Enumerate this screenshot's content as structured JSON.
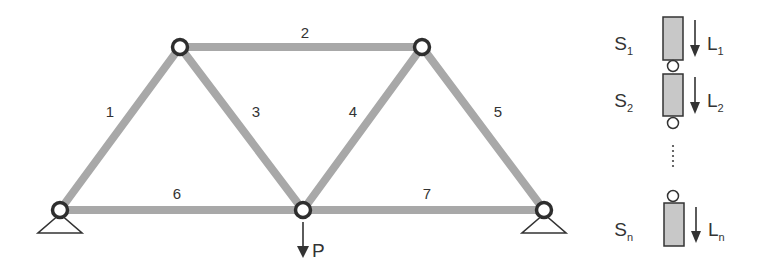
{
  "colors": {
    "background": "#ffffff",
    "member": "#a8a8a8",
    "node_stroke": "#2e2e2e",
    "node_fill": "#ffffff",
    "ink": "#333333",
    "element_fill": "#c8c8c8"
  },
  "truss": {
    "nodes": [
      {
        "id": "A",
        "x": 60,
        "y": 210,
        "support": "pin"
      },
      {
        "id": "B",
        "x": 180,
        "y": 47,
        "support": "none"
      },
      {
        "id": "C",
        "x": 303,
        "y": 210,
        "support": "none"
      },
      {
        "id": "D",
        "x": 422,
        "y": 47,
        "support": "none"
      },
      {
        "id": "E",
        "x": 544,
        "y": 210,
        "support": "pin"
      }
    ],
    "members": [
      {
        "label": "1",
        "from": "A",
        "to": "B",
        "label_x": 110,
        "label_y": 117
      },
      {
        "label": "2",
        "from": "B",
        "to": "D",
        "label_x": 305,
        "label_y": 38
      },
      {
        "label": "3",
        "from": "B",
        "to": "C",
        "label_x": 256,
        "label_y": 117
      },
      {
        "label": "4",
        "from": "C",
        "to": "D",
        "label_x": 353,
        "label_y": 117
      },
      {
        "label": "5",
        "from": "D",
        "to": "E",
        "label_x": 498,
        "label_y": 117
      },
      {
        "label": "6",
        "from": "A",
        "to": "C",
        "label_x": 177,
        "label_y": 199
      },
      {
        "label": "7",
        "from": "C",
        "to": "E",
        "label_x": 427,
        "label_y": 199
      }
    ],
    "load": {
      "label": "P",
      "node": "C",
      "direction": "down"
    }
  },
  "series_system": {
    "elements": [
      {
        "strength": "S",
        "strength_sub": "1",
        "load": "L",
        "load_sub": "1"
      },
      {
        "strength": "S",
        "strength_sub": "2",
        "load": "L",
        "load_sub": "2"
      },
      {
        "strength": "S",
        "strength_sub": "n",
        "load": "L",
        "load_sub": "n"
      }
    ],
    "ellipsis": "⋮"
  }
}
